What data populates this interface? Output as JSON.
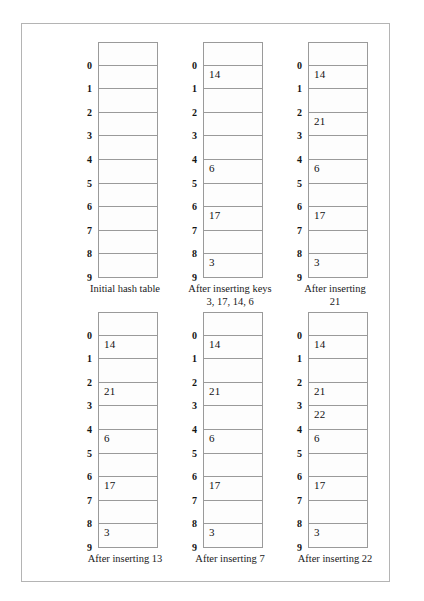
{
  "figure": {
    "kind": "hash-table-insertion-sequence",
    "slot_count": 10,
    "slot_indices": [
      "0",
      "1",
      "2",
      "3",
      "4",
      "5",
      "6",
      "7",
      "8",
      "9"
    ],
    "border_color": "#9a9a9a",
    "page_border_color": "#b4b4b4",
    "text_color": "#1a1a1a",
    "panels": [
      {
        "id": "initial-hash-table",
        "caption": "Initial hash table",
        "cells": [
          "",
          "",
          "",
          "",
          "",
          "",
          "",
          "",
          "",
          ""
        ]
      },
      {
        "id": "after-inserting-keys-3-17-14-6",
        "caption": "After inserting keys\n3, 17, 14, 6",
        "cells": [
          "",
          "14",
          "",
          "",
          "",
          "6",
          "",
          "17",
          "",
          "3"
        ]
      },
      {
        "id": "after-inserting-21",
        "caption": "After inserting\n21",
        "cells": [
          "",
          "14",
          "",
          "21",
          "",
          "6",
          "",
          "17",
          "",
          "3"
        ]
      },
      {
        "id": "after-inserting-13",
        "caption": "After inserting 13",
        "cells": [
          "",
          "14",
          "",
          "21",
          "",
          "6",
          "",
          "17",
          "",
          "3"
        ]
      },
      {
        "id": "after-inserting-7",
        "caption": "After inserting 7",
        "cells": [
          "",
          "14",
          "",
          "21",
          "",
          "6",
          "",
          "17",
          "",
          "3"
        ]
      },
      {
        "id": "after-inserting-22",
        "caption": "After inserting 22",
        "cells": [
          "",
          "14",
          "",
          "21",
          "22",
          "6",
          "",
          "17",
          "",
          "3"
        ]
      }
    ]
  }
}
